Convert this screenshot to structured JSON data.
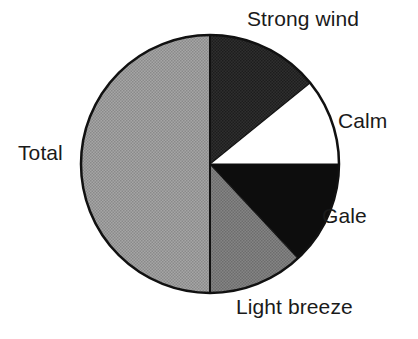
{
  "figure": {
    "title": "",
    "background_color": "#ffffff"
  },
  "chart_data": {
    "type": "pie",
    "title": "",
    "xlabel": "",
    "ylabel": "",
    "legend_position": "none",
    "labels_position": "outside-callout",
    "grid": false,
    "start_angle_deg": 0,
    "direction": "clockwise",
    "categories": [
      "Strong wind",
      "Calm",
      "Gale",
      "Light breeze",
      "Total"
    ],
    "values": [
      14.2,
      10.8,
      13.1,
      11.9,
      50.0
    ],
    "units": "percent",
    "slices": [
      {
        "label": "Strong wind",
        "value": 14.2,
        "start_angle_deg": 0,
        "end_angle_deg": 51,
        "color": "#2e2e2e",
        "fill": "dark-gray"
      },
      {
        "label": "Calm",
        "value": 10.8,
        "start_angle_deg": 51,
        "end_angle_deg": 90,
        "color": "#ffffff",
        "fill": "white"
      },
      {
        "label": "Gale",
        "value": 13.1,
        "start_angle_deg": 90,
        "end_angle_deg": 137,
        "color": "#0d0d0d",
        "fill": "black"
      },
      {
        "label": "Light breeze",
        "value": 11.9,
        "start_angle_deg": 137,
        "end_angle_deg": 180,
        "color": "#7c7c7c",
        "fill": "medium-gray"
      },
      {
        "label": "Total",
        "value": 50.0,
        "start_angle_deg": 180,
        "end_angle_deg": 360,
        "color": "#9a9a9a",
        "fill": "light-gray"
      }
    ],
    "geometry": {
      "center_x": 210,
      "center_y": 164,
      "radius": 129,
      "outline_color": "#111111",
      "outline_width": 2.5
    }
  },
  "labels": {
    "strong_wind": "Strong wind",
    "calm": "Calm",
    "gale": "Gale",
    "light_breeze": "Light breeze",
    "total": "Total"
  }
}
